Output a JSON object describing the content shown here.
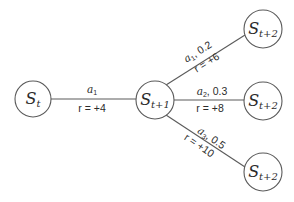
{
  "diagram": {
    "type": "state-transition-tree",
    "nodes": [
      {
        "id": "st",
        "label": "S",
        "subscript": "t"
      },
      {
        "id": "st1",
        "label": "S",
        "subscript": "t+1"
      },
      {
        "id": "st2a",
        "label": "S",
        "subscript": "t+2"
      },
      {
        "id": "st2b",
        "label": "S",
        "subscript": "t+2"
      },
      {
        "id": "st2c",
        "label": "S",
        "subscript": "t+2"
      }
    ],
    "edges": [
      {
        "from": "st",
        "to": "st1",
        "action": "a",
        "action_sub": "1",
        "prob": "",
        "reward": "r = +4"
      },
      {
        "from": "st1",
        "to": "st2a",
        "action": "a",
        "action_sub": "1",
        "prob": ", 0.2",
        "reward": "r = +6"
      },
      {
        "from": "st1",
        "to": "st2b",
        "action": "a",
        "action_sub": "2",
        "prob": ", 0.3",
        "reward": "r = +8"
      },
      {
        "from": "st1",
        "to": "st2c",
        "action": "a",
        "action_sub": "3",
        "prob": ", 0.5",
        "reward": "r = +10"
      }
    ]
  }
}
